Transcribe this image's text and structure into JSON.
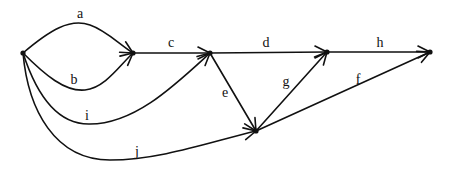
{
  "diagram": {
    "type": "directed-graph",
    "nodes": [
      {
        "id": "n1",
        "x": 23,
        "y": 53
      },
      {
        "id": "n2",
        "x": 133,
        "y": 53
      },
      {
        "id": "n3",
        "x": 210,
        "y": 53
      },
      {
        "id": "n4",
        "x": 327,
        "y": 52
      },
      {
        "id": "n5",
        "x": 256,
        "y": 131
      },
      {
        "id": "n6",
        "x": 430,
        "y": 52
      }
    ],
    "edges": [
      {
        "id": "a",
        "label": "a",
        "from": "n1",
        "to": "n2",
        "path": "M23,53 C50,30 70,18 90,25 C105,30 118,43 133,53",
        "lx": 80,
        "ly": 18,
        "ax": 133,
        "ay": 53,
        "angle": 30
      },
      {
        "id": "b",
        "label": "b",
        "from": "n1",
        "to": "n2",
        "path": "M23,53 C45,75 65,92 85,90 C105,88 120,65 133,53",
        "lx": 74,
        "ly": 84,
        "ax": 133,
        "ay": 53,
        "angle": -40
      },
      {
        "id": "c",
        "label": "c",
        "from": "n2",
        "to": "n3",
        "path": "M133,53 L210,53",
        "lx": 171,
        "ly": 47,
        "ax": 210,
        "ay": 53,
        "angle": 0
      },
      {
        "id": "d",
        "label": "d",
        "from": "n3",
        "to": "n4",
        "path": "M210,53 L327,52",
        "lx": 266,
        "ly": 47,
        "ax": 327,
        "ay": 52,
        "angle": 0
      },
      {
        "id": "h",
        "label": "h",
        "from": "n4",
        "to": "n6",
        "path": "M327,52 L430,52",
        "lx": 380,
        "ly": 47,
        "ax": 430,
        "ay": 52,
        "angle": 0
      },
      {
        "id": "e",
        "label": "e",
        "from": "n3",
        "to": "n5",
        "path": "M210,53 L256,131",
        "lx": 225,
        "ly": 97,
        "ax": 256,
        "ay": 131,
        "angle": 59
      },
      {
        "id": "g",
        "label": "g",
        "from": "n5",
        "to": "n4",
        "path": "M256,131 L327,52",
        "lx": 286,
        "ly": 86,
        "ax": 327,
        "ay": 52,
        "angle": -48
      },
      {
        "id": "f",
        "label": "f",
        "from": "n5",
        "to": "n6",
        "path": "M256,131 L430,52",
        "lx": 358,
        "ly": 84,
        "ax": 430,
        "ay": 52,
        "angle": -24
      },
      {
        "id": "i",
        "label": "i",
        "from": "n1",
        "to": "n3",
        "path": "M23,53 C35,90 55,125 90,124 C135,124 175,85 210,53",
        "lx": 87,
        "ly": 120,
        "ax": 210,
        "ay": 53,
        "angle": -42
      },
      {
        "id": "j",
        "label": "j",
        "from": "n1",
        "to": "n5",
        "path": "M23,53 C28,110 55,160 110,160 C160,160 210,142 256,131",
        "lx": 137,
        "ly": 156,
        "ax": 256,
        "ay": 131,
        "angle": -13
      }
    ]
  }
}
